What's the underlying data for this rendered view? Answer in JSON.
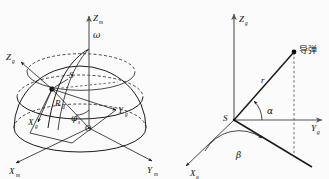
{
  "figure": {
    "background_color": "#fbfbfb",
    "ink_color": "#1a1a1a",
    "panels": [
      {
        "id": "left",
        "name": "hemisphere-coordinate-diagram",
        "labels": {
          "axis_zm": "Z",
          "axis_zm_sub": "m",
          "axis_xm": "X",
          "axis_xm_sub": "m",
          "axis_ym": "Y",
          "axis_ym_sub": "m",
          "axis_zg": "Z",
          "axis_zg_sub": "g",
          "axis_xg": "X",
          "axis_xg_sub": "g",
          "axis_yg": "Y",
          "axis_yg_sub": "g",
          "origin": "O",
          "point_s": "S",
          "radius": "R",
          "radius_sub": "d",
          "angle_phi": "φ",
          "angle_phi_sub": "s",
          "omega": "ω"
        }
      },
      {
        "id": "right",
        "name": "missile-azimuth-elevation-diagram",
        "labels": {
          "axis_zg": "Z",
          "axis_zg_sub": "g",
          "axis_yg": "Y",
          "axis_yg_sub": "g",
          "axis_xg": "X",
          "axis_xg_sub": "g",
          "origin_s": "S",
          "range_r": "r",
          "angle_alpha": "α",
          "angle_beta": "β",
          "target": "导弹"
        }
      }
    ]
  }
}
